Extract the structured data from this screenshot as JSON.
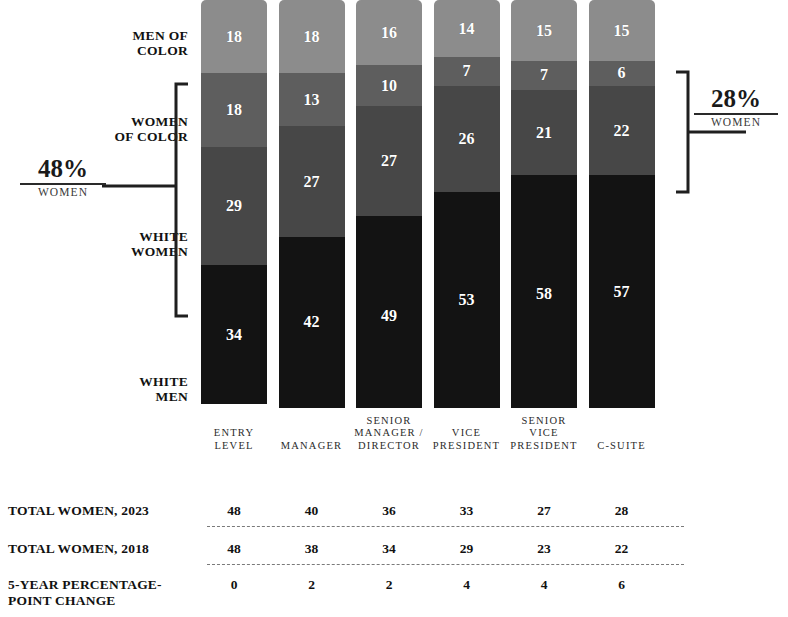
{
  "chart_data": {
    "type": "bar",
    "subtype": "stacked-bar-100",
    "title": "",
    "xlabel": "",
    "ylabel": "",
    "ylim": [
      0,
      100
    ],
    "grid": false,
    "legend_position": "left-axis-labels",
    "categories": [
      "ENTRY LEVEL",
      "MANAGER",
      "SENIOR MANAGER / DIRECTOR",
      "VICE PRESIDENT",
      "SENIOR VICE PRESIDENT",
      "C-SUITE"
    ],
    "category_lines": [
      [
        "ENTRY",
        "LEVEL"
      ],
      [
        "MANAGER"
      ],
      [
        "SENIOR",
        "MANAGER /",
        "DIRECTOR"
      ],
      [
        "VICE",
        "PRESIDENT"
      ],
      [
        "SENIOR",
        "VICE",
        "PRESIDENT"
      ],
      [
        "C-SUITE"
      ]
    ],
    "series": [
      {
        "name": "WHITE MEN",
        "color": "#131313",
        "values": [
          34,
          42,
          49,
          53,
          58,
          57
        ]
      },
      {
        "name": "WHITE WOMEN",
        "color": "#474747",
        "values": [
          29,
          27,
          27,
          26,
          21,
          22
        ]
      },
      {
        "name": "WOMEN OF COLOR",
        "color": "#5e5e5e",
        "values": [
          18,
          13,
          10,
          7,
          7,
          6
        ]
      },
      {
        "name": "MEN OF COLOR",
        "color": "#8c8c8c",
        "values": [
          18,
          18,
          16,
          14,
          15,
          15
        ]
      }
    ],
    "stack_order_bottom_to_top": [
      "WHITE MEN",
      "WHITE WOMEN",
      "WOMEN OF COLOR",
      "MEN OF COLOR"
    ],
    "annotations": [
      {
        "name": "entry-level-women-callout",
        "value": "48%",
        "sub": "WOMEN",
        "target": "ENTRY LEVEL"
      },
      {
        "name": "c-suite-women-callout",
        "value": "28%",
        "sub": "WOMEN",
        "target": "C-SUITE"
      }
    ]
  },
  "category_labels": [
    {
      "id": "men-of-color",
      "lines": [
        "MEN OF",
        "COLOR"
      ]
    },
    {
      "id": "women-of-color",
      "lines": [
        "WOMEN",
        "OF COLOR"
      ]
    },
    {
      "id": "white-women",
      "lines": [
        "WHITE",
        "WOMEN"
      ]
    },
    {
      "id": "white-men",
      "lines": [
        "WHITE",
        "MEN"
      ]
    }
  ],
  "callouts": {
    "left": {
      "pct": "48%",
      "sub": "WOMEN"
    },
    "right": {
      "pct": "28%",
      "sub": "WOMEN"
    }
  },
  "table": {
    "rows": [
      {
        "id": "total-women-2023",
        "label": "TOTAL WOMEN, 2023",
        "values": [
          "48",
          "40",
          "36",
          "33",
          "27",
          "28"
        ]
      },
      {
        "id": "total-women-2018",
        "label": "TOTAL WOMEN, 2018",
        "values": [
          "48",
          "38",
          "34",
          "29",
          "23",
          "22"
        ]
      },
      {
        "id": "five-year-change",
        "label": "5-YEAR PERCENTAGE-POINT CHANGE",
        "label_lines": [
          "5-YEAR PERCENTAGE-",
          "POINT CHANGE"
        ],
        "values": [
          "0",
          "2",
          "2",
          "4",
          "4",
          "6"
        ]
      }
    ]
  },
  "colors": {
    "white_men": "#131313",
    "white_women": "#474747",
    "women_of_color": "#5e5e5e",
    "men_of_color": "#8c8c8c",
    "text": "#111111",
    "rule": "#2a2a2a",
    "dashed_rule": "#7a7a7a"
  }
}
